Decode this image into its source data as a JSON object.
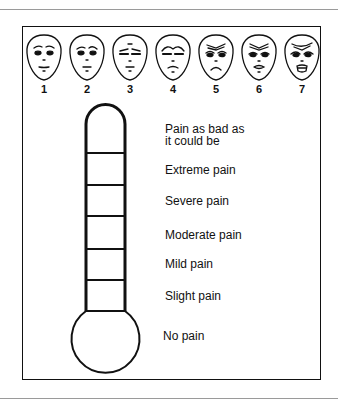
{
  "faces": {
    "labels": [
      "1",
      "2",
      "3",
      "4",
      "5",
      "6",
      "7"
    ]
  },
  "thermometer": {
    "levels": [
      {
        "line1": "Pain as bad as",
        "line2": "it could be"
      },
      {
        "line1": "Extreme pain"
      },
      {
        "line1": "Severe pain"
      },
      {
        "line1": "Moderate pain"
      },
      {
        "line1": "Mild pain"
      },
      {
        "line1": "Slight pain"
      },
      {
        "line1": "No pain"
      }
    ]
  },
  "colors": {
    "ink": "#111111",
    "rule": "#9a9a9a",
    "background": "#ffffff"
  }
}
